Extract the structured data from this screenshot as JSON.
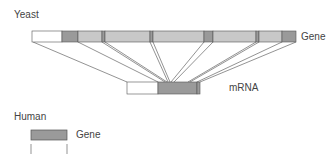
{
  "labels": {
    "yeast": "Yeast",
    "yeast_gene": "Gene",
    "mrna": "mRNA",
    "human": "Human",
    "human_gene": "Gene"
  },
  "colors": {
    "intron": "#c8c8c8",
    "exon": "#9a9a9a",
    "utr": "#ffffff",
    "outline": "#555555",
    "line": "#666666"
  },
  "yeast_gene_segments": [
    {
      "x": 32,
      "w": 30,
      "type": "utr"
    },
    {
      "x": 62,
      "w": 16,
      "type": "exon"
    },
    {
      "x": 78,
      "w": 24,
      "type": "intron"
    },
    {
      "x": 102,
      "w": 3,
      "type": "exon"
    },
    {
      "x": 105,
      "w": 45,
      "type": "intron"
    },
    {
      "x": 150,
      "w": 3,
      "type": "exon"
    },
    {
      "x": 153,
      "w": 51,
      "type": "intron"
    },
    {
      "x": 204,
      "w": 9,
      "type": "exon"
    },
    {
      "x": 213,
      "w": 43,
      "type": "intron"
    },
    {
      "x": 256,
      "w": 3,
      "type": "exon"
    },
    {
      "x": 259,
      "w": 23,
      "type": "intron"
    },
    {
      "x": 282,
      "w": 14,
      "type": "exon"
    }
  ],
  "mrna_segments": [
    {
      "x": 127,
      "w": 31,
      "type": "utr"
    },
    {
      "x": 158,
      "w": 39,
      "type": "exon"
    },
    {
      "x": 197,
      "w": 3,
      "type": "exon"
    }
  ]
}
